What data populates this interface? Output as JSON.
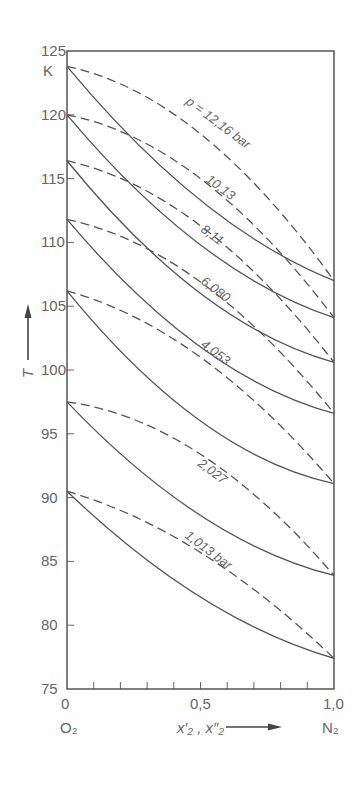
{
  "chart_data": {
    "type": "line",
    "title": "",
    "xlabel": "x'_2, x''_2",
    "ylabel": "T",
    "yunit": "K",
    "xlim": [
      0,
      1.0
    ],
    "ylim": [
      75,
      125
    ],
    "x_ticks": [
      0,
      0.1,
      0.2,
      0.3,
      0.4,
      0.5,
      0.6,
      0.7,
      0.8,
      0.9,
      1.0
    ],
    "x_tick_labels": [
      "0",
      "0,5",
      "1,0"
    ],
    "y_tick_labels": [
      "75",
      "80",
      "85",
      "90",
      "95",
      "100",
      "105",
      "110",
      "115",
      "120",
      "125"
    ],
    "x_left_label": "O2",
    "x_right_label": "N2",
    "grid": false,
    "x": [
      0,
      0.5,
      1.0
    ],
    "series": [
      {
        "name": "p = 12.16 bar",
        "label": "p = 12,16 bar",
        "bubble": [
          123.8,
          113.3,
          107.0
        ],
        "dew": [
          123.8,
          118.5,
          107.0
        ]
      },
      {
        "name": "10.13",
        "label": "10,13",
        "bubble": [
          120.0,
          109.8,
          104.1
        ],
        "dew": [
          120.0,
          115.0,
          104.1
        ]
      },
      {
        "name": "8.11",
        "label": "8,11",
        "bubble": [
          116.4,
          106.0,
          100.6
        ],
        "dew": [
          116.4,
          111.3,
          100.6
        ]
      },
      {
        "name": "6.080",
        "label": "6,080",
        "bubble": [
          111.8,
          101.8,
          96.6
        ],
        "dew": [
          111.8,
          106.9,
          96.6
        ]
      },
      {
        "name": "4.053",
        "label": "4,053",
        "bubble": [
          106.2,
          96.0,
          91.1
        ],
        "dew": [
          106.2,
          101.0,
          91.1
        ]
      },
      {
        "name": "2.027",
        "label": "2,027",
        "bubble": [
          97.5,
          88.6,
          83.9
        ],
        "dew": [
          97.5,
          93.4,
          83.9
        ]
      },
      {
        "name": "1.013 bar",
        "label": "1,013 bar",
        "bubble": [
          90.5,
          82.2,
          77.4
        ],
        "dew": [
          90.5,
          85.7,
          77.4
        ]
      }
    ],
    "legend": "none (inline curve labels)",
    "annotations": [
      "K",
      "T →",
      "x'2, x''2 →"
    ]
  },
  "axis": {
    "unit_label": "K",
    "y_title": "T",
    "x_title": "x′₂ , x″₂",
    "x_left": "O₂",
    "x_right": "N₂",
    "x_tick_0": "0",
    "x_tick_mid": "0,5",
    "x_tick_end": "1,0"
  }
}
